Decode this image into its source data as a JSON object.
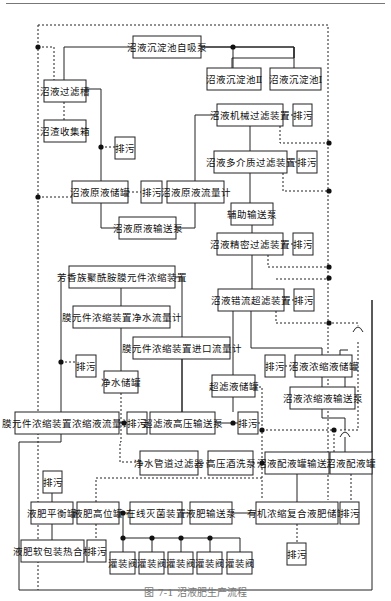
{
  "diagram": {
    "nodes": [
      {
        "id": "n1",
        "label": "沼液沉淀池自吸泵",
        "x": 133,
        "y": 36,
        "w": 68,
        "h": 22
      },
      {
        "id": "n2",
        "label": "沼液沉淀池Ⅱ",
        "x": 207,
        "y": 68,
        "w": 54,
        "h": 22
      },
      {
        "id": "n3",
        "label": "沼液沉淀池Ⅰ",
        "x": 270,
        "y": 68,
        "w": 51,
        "h": 22
      },
      {
        "id": "n4",
        "label": "沼液过滤槽",
        "x": 44,
        "y": 80,
        "w": 42,
        "h": 22
      },
      {
        "id": "n5",
        "label": "沼渣收集箱",
        "x": 44,
        "y": 120,
        "w": 42,
        "h": 22
      },
      {
        "id": "n6",
        "label": "沼液机械过滤装置",
        "x": 217,
        "y": 104,
        "w": 66,
        "h": 22
      },
      {
        "id": "n7",
        "label": "排污",
        "x": 293,
        "y": 104,
        "w": 19,
        "h": 22
      },
      {
        "id": "n8",
        "label": "排污",
        "x": 115,
        "y": 137,
        "w": 20,
        "h": 22
      },
      {
        "id": "n9",
        "label": "沼液多介质过滤装置",
        "x": 214,
        "y": 151,
        "w": 73,
        "h": 22
      },
      {
        "id": "n10",
        "label": "排污",
        "x": 297,
        "y": 151,
        "w": 20,
        "h": 22
      },
      {
        "id": "n11",
        "label": "沼液原液储罐",
        "x": 72,
        "y": 181,
        "w": 56,
        "h": 22
      },
      {
        "id": "n12",
        "label": "排污",
        "x": 141,
        "y": 181,
        "w": 21,
        "h": 22
      },
      {
        "id": "n13",
        "label": "沼液原液流量计",
        "x": 167,
        "y": 181,
        "w": 57,
        "h": 22
      },
      {
        "id": "n14",
        "label": "辅助输送泵",
        "x": 231,
        "y": 203,
        "w": 42,
        "h": 22
      },
      {
        "id": "n15",
        "label": "沼液原液输送泵",
        "x": 119,
        "y": 217,
        "w": 57,
        "h": 22
      },
      {
        "id": "n16",
        "label": "沼液精密过滤装置",
        "x": 217,
        "y": 233,
        "w": 66,
        "h": 22
      },
      {
        "id": "n17",
        "label": "排污",
        "x": 293,
        "y": 233,
        "w": 20,
        "h": 22
      },
      {
        "id": "n18",
        "label": "芳香族聚酰胺膜元件浓缩装置",
        "x": 69,
        "y": 266,
        "w": 106,
        "h": 22
      },
      {
        "id": "n19",
        "label": "沼液错流超滤装置",
        "x": 218,
        "y": 289,
        "w": 66,
        "h": 22
      },
      {
        "id": "n20",
        "label": "排污",
        "x": 294,
        "y": 289,
        "w": 20,
        "h": 22
      },
      {
        "id": "n21",
        "label": "膜元件浓缩装置净水流量计",
        "x": 73,
        "y": 306,
        "w": 97,
        "h": 22
      },
      {
        "id": "n22",
        "label": "膜元件浓缩装置进口流量计",
        "x": 133,
        "y": 337,
        "w": 97,
        "h": 22
      },
      {
        "id": "n23",
        "label": "排污",
        "x": 76,
        "y": 355,
        "w": 20,
        "h": 22
      },
      {
        "id": "n24",
        "label": "排污",
        "x": 265,
        "y": 355,
        "w": 20,
        "h": 22
      },
      {
        "id": "n25",
        "label": "沼液浓缩液储罐",
        "x": 295,
        "y": 355,
        "w": 57,
        "h": 22
      },
      {
        "id": "n26",
        "label": "净水储罐",
        "x": 104,
        "y": 371,
        "w": 34,
        "h": 22
      },
      {
        "id": "n27",
        "label": "超滤液储罐",
        "x": 212,
        "y": 375,
        "w": 43,
        "h": 22
      },
      {
        "id": "n28",
        "label": "沼液浓缩液输送泵",
        "x": 290,
        "y": 387,
        "w": 65,
        "h": 22
      },
      {
        "id": "n29",
        "label": "膜元件浓缩装置浓缩液流量计",
        "x": 15,
        "y": 412,
        "w": 104,
        "h": 22
      },
      {
        "id": "n30",
        "label": "排污",
        "x": 127,
        "y": 412,
        "w": 20,
        "h": 22
      },
      {
        "id": "n31",
        "label": "超滤液高压输送泵",
        "x": 150,
        "y": 412,
        "w": 65,
        "h": 22
      },
      {
        "id": "n32",
        "label": "排污",
        "x": 238,
        "y": 412,
        "w": 20,
        "h": 22
      },
      {
        "id": "n33",
        "label": "净水管道过滤器",
        "x": 140,
        "y": 451,
        "w": 58,
        "h": 24
      },
      {
        "id": "n34",
        "label": "高压酒洗泵",
        "x": 208,
        "y": 451,
        "w": 45,
        "h": 24
      },
      {
        "id": "n35",
        "label": "沼液配液罐输送泵",
        "x": 265,
        "y": 452,
        "w": 64,
        "h": 22
      },
      {
        "id": "n36",
        "label": "沼液配液罐",
        "x": 330,
        "y": 452,
        "w": 42,
        "h": 22
      },
      {
        "id": "n37",
        "label": "排污",
        "x": 43,
        "y": 471,
        "w": 19,
        "h": 22
      },
      {
        "id": "n38",
        "label": "液肥平衡罐",
        "x": 31,
        "y": 502,
        "w": 42,
        "h": 22
      },
      {
        "id": "n39",
        "label": "液肥高位罐",
        "x": 77,
        "y": 502,
        "w": 42,
        "h": 22
      },
      {
        "id": "n40",
        "label": "在线灭菌装置",
        "x": 130,
        "y": 502,
        "w": 52,
        "h": 22
      },
      {
        "id": "n41",
        "label": "液肥输送泵",
        "x": 190,
        "y": 502,
        "w": 42,
        "h": 22
      },
      {
        "id": "n42",
        "label": "有机浓缩复合液肥储罐",
        "x": 256,
        "y": 502,
        "w": 82,
        "h": 22
      },
      {
        "id": "n43",
        "label": "排污",
        "x": 340,
        "y": 502,
        "w": 19,
        "h": 22
      },
      {
        "id": "n44",
        "label": "液肥软包装热合机",
        "x": 21,
        "y": 540,
        "w": 63,
        "h": 22
      },
      {
        "id": "n45",
        "label": "排污",
        "x": 87,
        "y": 540,
        "w": 19,
        "h": 22
      },
      {
        "id": "n46",
        "label": "排污",
        "x": 287,
        "y": 543,
        "w": 19,
        "h": 22
      },
      {
        "id": "n47",
        "label": "灌装阀",
        "x": 110,
        "y": 552,
        "w": 25,
        "h": 22
      },
      {
        "id": "n48",
        "label": "灌装阀",
        "x": 139,
        "y": 552,
        "w": 25,
        "h": 22
      },
      {
        "id": "n49",
        "label": "灌装阀",
        "x": 168,
        "y": 552,
        "w": 25,
        "h": 22
      },
      {
        "id": "n50",
        "label": "灌装阀",
        "x": 197,
        "y": 552,
        "w": 25,
        "h": 22
      },
      {
        "id": "n51",
        "label": "灌装阀",
        "x": 227,
        "y": 552,
        "w": 25,
        "h": 22
      }
    ],
    "solid_lines": [
      "M64 80 V47 H133",
      "M201 47 H294 V58 H232 V68 M294 58 H294 M294 47 H294 M294 58 V47 M232 58 H232",
      "M294 47 V47",
      "M201 47 H294 M233 47 V68 M294 47 V68",
      "M86 89 H101 V192 H72",
      "M101 192 V228 H119",
      "M176 228 H195 V181",
      "M195 181 V115 H217",
      "M250 126 V151",
      "M250 173 V203",
      "M252 225 V233",
      "M252 255 V289",
      "M61 277 V423",
      "M175 277 H182 V412",
      "M121 288 V306",
      "M121 328 V371",
      "M182 359 V412",
      "M233 311 V412",
      "M251 311 V348 H322 V355",
      "M322 377 V387",
      "M322 409 V418 H345 V452",
      "M345 392 V360",
      "M340 367 V350 H348",
      "M215 423 H238",
      "M119 423 H124",
      "M61 434 V442 H19 V590 H372 V300 M372 452 V300",
      "M52 493 V502",
      "M52 524 V540",
      "M73 513 H77",
      "M119 513 H130",
      "M182 513 H190",
      "M232 513 H256",
      "M297 474 V502",
      "M123 513 V538 H240 V552",
      "M123 538 V552",
      "M152 538 V552",
      "M181 538 V552",
      "M210 538 V552"
    ],
    "dashed_lines": [
      "M38 25 H328 V500",
      "M38 25 V590",
      "M38 47 H54 V80",
      "M64 102 V120",
      "M101 147 H115",
      "M38 197 H86 V181",
      "M128 192 H141",
      "M283 115 H293",
      "M280 126 V143 H329",
      "M287 162 H297",
      "M283 173 V191 H329",
      "M283 244 H293",
      "M268 255 V267 H329",
      "M276 279 H329",
      "M284 300 H294",
      "M276 311 V323 H358 V332",
      "M61 362 H76",
      "M285 366 H295",
      "M255 387 H262 V500",
      "M121 393 V442 H120 V462 H140",
      "M258 423 H262",
      "M262 430 H334 M340 430 H358 V340",
      "M198 463 H208",
      "M253 463 H262",
      "M262 478 H96 V502",
      "M334 430 V452",
      "M351 474 V502",
      "M96 524 V540",
      "M297 524 V543",
      "M147 423 H150"
    ],
    "dots": [
      [
        38,
        47
      ],
      [
        233,
        47
      ],
      [
        101,
        147
      ],
      [
        38,
        197
      ],
      [
        329,
        143
      ],
      [
        329,
        191
      ],
      [
        329,
        278
      ],
      [
        329,
        267
      ],
      [
        329,
        323
      ],
      [
        61,
        362
      ],
      [
        124,
        423
      ],
      [
        233,
        423
      ],
      [
        262,
        430
      ],
      [
        334,
        430
      ],
      [
        262,
        463
      ],
      [
        123,
        513
      ],
      [
        123,
        538
      ],
      [
        152,
        538
      ],
      [
        181,
        538
      ],
      [
        210,
        538
      ]
    ],
    "bridges": [
      "M353 332 Q358 322 363 332",
      "M340 437 Q345 427 350 437"
    ]
  },
  "caption": "图 7-1  沼液肥生产流程"
}
